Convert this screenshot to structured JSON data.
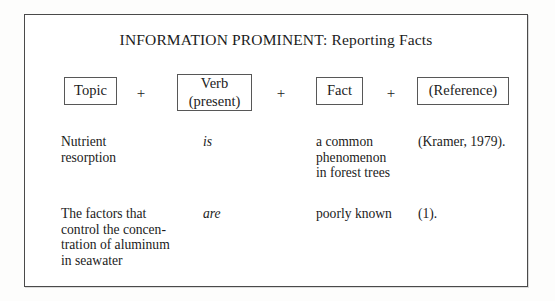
{
  "figure": {
    "title": "INFORMATION PROMINENT: Reporting Facts",
    "border_color": "#4a4a4a",
    "box_border_color": "#575757",
    "text_color": "#1b1b1b",
    "background": "#ffffff"
  },
  "pattern": {
    "slots": [
      {
        "name": "topic",
        "line1": "Topic",
        "line2": ""
      },
      {
        "name": "verb",
        "line1": "Verb",
        "line2": "(present)"
      },
      {
        "name": "fact",
        "line1": "Fact",
        "line2": ""
      },
      {
        "name": "reference",
        "line1": "(Reference)",
        "line2": ""
      }
    ],
    "operators": [
      "+",
      "+",
      "+"
    ]
  },
  "examples": [
    {
      "topic": "Nutrient\nresorption",
      "verb": "is",
      "fact": "a common\nphenomenon\nin forest trees",
      "reference": "(Kramer, 1979)."
    },
    {
      "topic": "The factors that\ncontrol the concen-\ntration of aluminum\nin seawater",
      "verb": "are",
      "fact": "poorly known",
      "reference": "(1)."
    }
  ]
}
